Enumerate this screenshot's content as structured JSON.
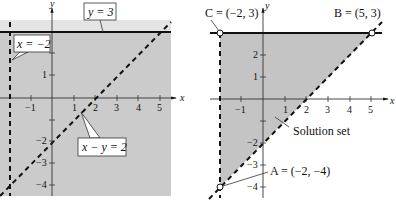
{
  "left_graph": {
    "axis_x_label": "x",
    "axis_y_label": "y",
    "x_ticks": [
      "−1",
      "1",
      "2",
      "3",
      "4",
      "5"
    ],
    "y_ticks": [
      "1",
      "−2",
      "−3",
      "−4"
    ],
    "callouts": {
      "horizontal_line": "y = 3",
      "vertical_line": "x = −2",
      "diagonal_line": "x − y = 2"
    },
    "colors": {
      "light_shade": "#e6e6e6",
      "dark_shade": "#c9c9c9",
      "line": "#111111"
    }
  },
  "right_graph": {
    "axis_x_label": "x",
    "axis_y_label": "y",
    "x_ticks": [
      "−1",
      "1",
      "2",
      "3",
      "4",
      "5"
    ],
    "y_ticks": [
      "2",
      "1",
      "−2",
      "−3",
      "−4"
    ],
    "labels": {
      "vertex_c": "C = (−2, 3)",
      "vertex_b": "B = (5, 3)",
      "vertex_a": "A = (−2, −4)",
      "region": "Solution set"
    },
    "colors": {
      "region": "#c4c4c4",
      "line": "#111111"
    }
  }
}
